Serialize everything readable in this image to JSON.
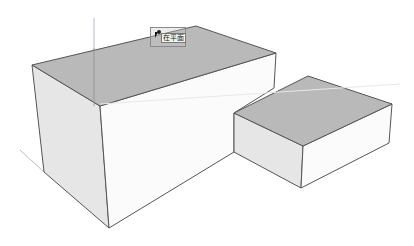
{
  "scene": {
    "background": "#ffffff",
    "colors": {
      "top_face": "#b9b9b9",
      "left_face": "#e6e6e6",
      "front_face": "#fbfbfb",
      "edge": "#555555",
      "axis_red": "#c8b8b8",
      "axis_green": "#d9e6d9",
      "axis_blue": "#b8b8c8"
    },
    "boxes": [
      {
        "name": "large-box",
        "top": [
          [
            32,
            65
          ],
          [
            196,
            26
          ],
          [
            276,
            53
          ],
          [
            100,
            106
          ]
        ],
        "left": [
          [
            32,
            65
          ],
          [
            100,
            106
          ],
          [
            109,
            228
          ],
          [
            44,
            172
          ]
        ],
        "front": [
          [
            100,
            106
          ],
          [
            276,
            53
          ],
          [
            274,
            88
          ],
          [
            234,
            113
          ],
          [
            234,
            152
          ],
          [
            109,
            228
          ]
        ]
      },
      {
        "name": "small-box",
        "top": [
          [
            234,
            113
          ],
          [
            308,
            76
          ],
          [
            392,
            104
          ],
          [
            303,
            146
          ]
        ],
        "left": [
          [
            234,
            113
          ],
          [
            303,
            146
          ],
          [
            301,
            188
          ],
          [
            234,
            152
          ]
        ],
        "front": [
          [
            303,
            146
          ],
          [
            392,
            104
          ],
          [
            389,
            143
          ],
          [
            301,
            188
          ]
        ]
      }
    ],
    "axes": {
      "blue": [
        [
          94,
          18
        ],
        [
          94,
          106
        ]
      ],
      "red": [
        [
          20,
          150
        ],
        [
          44,
          172
        ]
      ],
      "green": [
        [
          100,
          104
        ],
        [
          400,
          84
        ]
      ]
    }
  },
  "tooltip": {
    "label": "在平面",
    "icon": "cursor-arrow-icon"
  }
}
